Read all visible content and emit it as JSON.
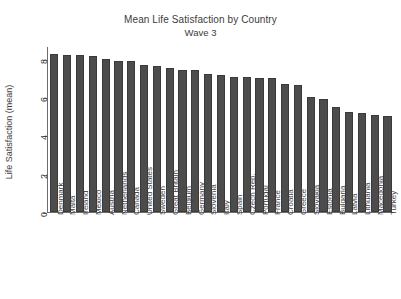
{
  "chart_data": {
    "type": "bar",
    "title": "Mean Life Satisfaction by Country",
    "subtitle": "Wave 3",
    "xlabel": "",
    "ylabel": "Life Satisfaction (mean)",
    "ylim": [
      0,
      8.6
    ],
    "yticks": [
      0,
      2,
      4,
      6,
      8
    ],
    "ytick_labels": [
      "0",
      "2",
      "4",
      "6",
      "8"
    ],
    "grid": false,
    "legend": false,
    "bar_color": "#4c4c4c",
    "background_color": "#ffffff",
    "axis_color": "#6d6d6d",
    "orientation": "vertical",
    "categories": [
      "Denmark",
      "Malta",
      "Ireland",
      "Mexico",
      "Austria",
      "Netherlands",
      "Canada",
      "United States",
      "Sweden",
      "Great Britain",
      "Belgium",
      "Germany",
      "Slovenia",
      "Italy",
      "Spain",
      "Czech Rep.",
      "Portugal",
      "France",
      "Croatia",
      "Greece",
      "Slovakia",
      "Estonia",
      "Bulgaria",
      "Latvia",
      "Lithuania",
      "Macedonia",
      "Turkey"
    ],
    "values": [
      8.25,
      8.2,
      8.2,
      8.15,
      8.0,
      7.85,
      7.85,
      7.65,
      7.6,
      7.5,
      7.4,
      7.4,
      7.2,
      7.15,
      7.05,
      7.05,
      7.0,
      7.0,
      6.65,
      6.6,
      6.0,
      5.9,
      5.45,
      5.2,
      5.15,
      5.05,
      5.0
    ]
  }
}
